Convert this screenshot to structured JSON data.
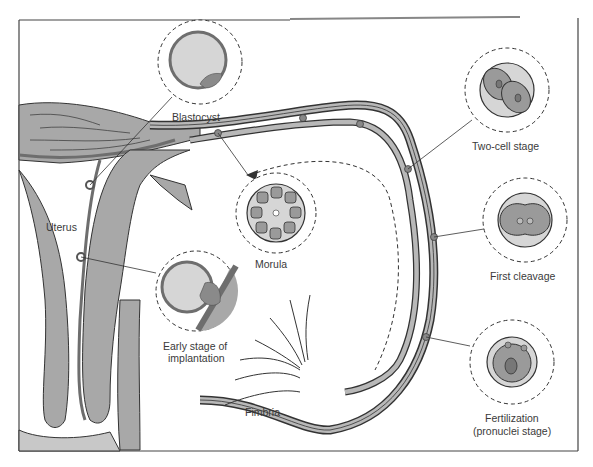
{
  "diagram": {
    "type": "anatomical-illustration",
    "colors": {
      "tissue_fill": "#a8a8a8",
      "tissue_dark": "#6e6e6e",
      "outline": "#333333",
      "embryo_fill": "#d6d6d6",
      "cell_fill": "#9a9a9a",
      "background": "#ffffff"
    }
  },
  "labels": {
    "uterus": "Uterus",
    "fimbria": "Fimbria",
    "blastocyst": "Blastocyst",
    "morula": "Morula",
    "two_cell": "Two-cell stage",
    "first_cleavage": "First cleavage",
    "fertilization_line1": "Fertilization",
    "fertilization_line2": "(pronuclei stage)",
    "implantation_line1": "Early stage of",
    "implantation_line2": "implantation"
  },
  "stages": [
    {
      "name": "Fertilization (pronuclei stage)",
      "order": 1
    },
    {
      "name": "First cleavage",
      "order": 2
    },
    {
      "name": "Two-cell stage",
      "order": 3
    },
    {
      "name": "Morula",
      "order": 4
    },
    {
      "name": "Blastocyst",
      "order": 5
    },
    {
      "name": "Early stage of implantation",
      "order": 6
    }
  ]
}
